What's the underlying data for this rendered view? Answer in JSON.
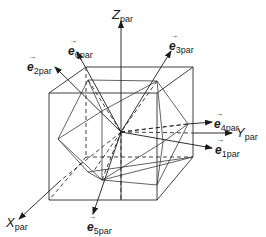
{
  "figure": {
    "axes": [
      {
        "id": "z",
        "main": "Z",
        "sub": "par"
      },
      {
        "id": "y",
        "main": "Y",
        "sub": "par"
      },
      {
        "id": "x",
        "main": "X",
        "sub": "par"
      }
    ],
    "vectors": [
      {
        "id": "e1",
        "main": "e",
        "sub": "1par"
      },
      {
        "id": "e2",
        "main": "e",
        "sub": "2par"
      },
      {
        "id": "e3",
        "main": "e",
        "sub": "3par"
      },
      {
        "id": "e4",
        "main": "e",
        "sub": "4par"
      },
      {
        "id": "e5",
        "main": "e",
        "sub": "5par"
      },
      {
        "id": "e6",
        "main": "e",
        "sub": "6par"
      }
    ],
    "arrow_glyph": "→",
    "colors": {
      "line": "#2a2a2a",
      "text": "#1a1a1a",
      "background": "#ffffff"
    }
  }
}
